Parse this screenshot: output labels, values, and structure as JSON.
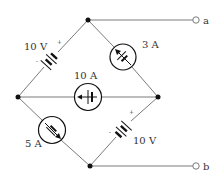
{
  "diagram": {
    "type": "bridge circuit",
    "colors": {
      "wire": "#7a7a7a",
      "component": "#111111",
      "text": "#333333",
      "background": "#ffffff"
    },
    "terminals": [
      {
        "id": "a",
        "label": "a"
      },
      {
        "id": "b",
        "label": "b"
      }
    ],
    "components": [
      {
        "id": "v1",
        "kind": "voltage-source",
        "label": "10 V",
        "plus": "+",
        "minus": "-",
        "branch": "left-node to top-node"
      },
      {
        "id": "i1",
        "kind": "current-source",
        "label": "3 A",
        "branch": "top-node to right-node"
      },
      {
        "id": "i2",
        "kind": "current-source",
        "label": "10 A",
        "branch": "left-node to right-node"
      },
      {
        "id": "i3",
        "kind": "current-source",
        "label": "5 A",
        "branch": "left-node to bottom-node"
      },
      {
        "id": "v2",
        "kind": "voltage-source",
        "label": "10 V",
        "plus": "+",
        "minus": "-",
        "branch": "bottom-node to right-node"
      }
    ]
  }
}
